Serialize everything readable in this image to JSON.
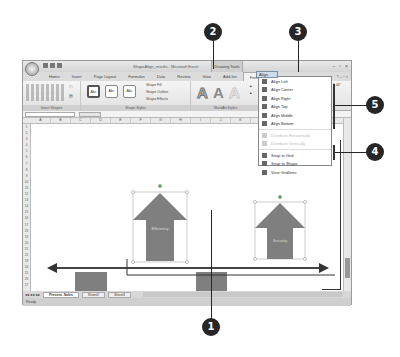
{
  "window": {
    "title": "ShapeAlign_results - Microsoft Excel",
    "contextual_tab_group": "Drawing Tools",
    "controls": [
      "minimize",
      "restore",
      "close"
    ]
  },
  "ribbon": {
    "tabs": [
      {
        "label": "Home"
      },
      {
        "label": "Insert"
      },
      {
        "label": "Page Layout"
      },
      {
        "label": "Formulas"
      },
      {
        "label": "Data"
      },
      {
        "label": "Review"
      },
      {
        "label": "View"
      },
      {
        "label": "Add-Ins"
      },
      {
        "label": "Format",
        "active": true
      }
    ],
    "groups": {
      "insert_shapes": "Insert Shapes",
      "shape_styles": "Shape Styles",
      "wordart_styles": "WordArt Styles",
      "arrange": "Arrange",
      "size": "Size"
    },
    "shape_styles": {
      "style_sample": "Abc",
      "fill": "Shape Fill",
      "outline": "Shape Outline",
      "effects": "Shape Effects"
    },
    "arrange": {
      "bring_to_front": "Bring to Front",
      "send_to_back": "Send to Back",
      "selection_pane": "Selection Pane",
      "align": "Align"
    },
    "wordart_sample": "A",
    "size_value": "1.44\""
  },
  "columns": [
    "A",
    "B",
    "C",
    "D",
    "E",
    "F",
    "G",
    "H",
    "I",
    "J",
    "K",
    "L",
    "M"
  ],
  "rows": [
    "1",
    "2",
    "3",
    "4",
    "5",
    "6",
    "7",
    "8",
    "9",
    "10",
    "11",
    "12",
    "13",
    "14",
    "15",
    "16",
    "17",
    "18",
    "19",
    "20",
    "21",
    "22",
    "23",
    "24",
    "25",
    "26",
    "27"
  ],
  "shapes": [
    {
      "type": "up-arrow",
      "label": "Efficiency"
    },
    {
      "type": "up-arrow",
      "label": "Security"
    },
    {
      "type": "down-arrow",
      "label": "Inventory"
    },
    {
      "type": "down-arrow",
      "label": "Costs"
    }
  ],
  "align_menu": {
    "items": [
      {
        "label": "Align Left",
        "enabled": true
      },
      {
        "label": "Align Center",
        "enabled": true
      },
      {
        "label": "Align Right",
        "enabled": true
      },
      {
        "label": "Align Top",
        "enabled": true
      },
      {
        "label": "Align Middle",
        "enabled": true
      },
      {
        "label": "Align Bottom",
        "enabled": true
      },
      {
        "label": "Distribute Horizontally",
        "enabled": false
      },
      {
        "label": "Distribute Vertically",
        "enabled": false
      },
      {
        "label": "Snap to Grid",
        "enabled": true
      },
      {
        "label": "Snap to Shape",
        "enabled": true
      },
      {
        "label": "View Gridlines",
        "enabled": true
      }
    ]
  },
  "sheet_tabs": [
    {
      "label": "Present. Sales",
      "active": true
    },
    {
      "label": "Sheet2"
    },
    {
      "label": "Sheet3"
    }
  ],
  "status": {
    "text": "Ready"
  },
  "callouts": [
    "1",
    "2",
    "3",
    "4",
    "5"
  ]
}
